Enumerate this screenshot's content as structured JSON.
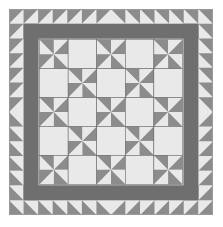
{
  "image": {
    "subject": "Pinwheel quilt pattern with sawtooth border",
    "colors": {
      "light": "#e9e9e9",
      "medium": "#8c8c8c",
      "dark": "#6f6f6f",
      "seam": "#5a5a5a",
      "background": "#ffffff"
    },
    "layout": {
      "border_squares_per_side": 14,
      "center_blocks_per_side": 5,
      "block_pattern": "checkerboard of pinwheel blocks and plain light squares; pinwheels at corners"
    }
  }
}
